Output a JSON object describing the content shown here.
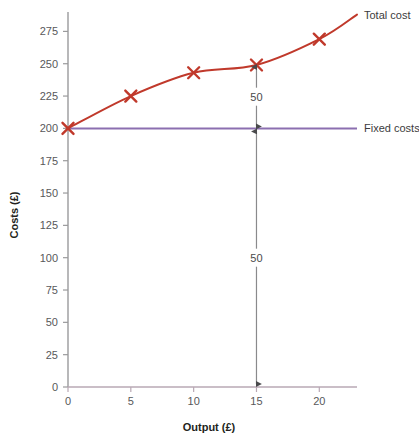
{
  "chart_data": {
    "type": "line",
    "title": "",
    "xlabel": "Output (£)",
    "ylabel": "Costs (£)",
    "xlim": [
      0,
      23
    ],
    "ylim": [
      0,
      290
    ],
    "grid": false,
    "legend_position": "right-of-plot-end-labels",
    "xticks": [
      "0",
      "5",
      "10",
      "15",
      "20"
    ],
    "xtick_values": [
      0,
      5,
      10,
      15,
      20
    ],
    "yticks": [
      "0",
      "25",
      "50",
      "75",
      "100",
      "125",
      "150",
      "175",
      "200",
      "225",
      "250",
      "275"
    ],
    "ytick_values": [
      0,
      25,
      50,
      75,
      100,
      125,
      150,
      175,
      200,
      225,
      250,
      275
    ],
    "series": [
      {
        "name": "Total cost",
        "color": "#c0392b",
        "marker": "x",
        "x": [
          0,
          5,
          10,
          15,
          20
        ],
        "values": [
          200,
          225,
          243,
          249,
          269
        ],
        "curve_end": {
          "x": 23,
          "y": 288
        }
      },
      {
        "name": "Fixed costs",
        "color": "#8b6fb0",
        "marker": "none",
        "x": [
          0,
          23
        ],
        "values": [
          200,
          200
        ]
      }
    ],
    "annotations": [
      {
        "label": "50",
        "at_x": 15,
        "from_y": 249,
        "to_y": 200,
        "meaning": "variable cost at output 15"
      },
      {
        "label": "50",
        "at_x": 15,
        "from_y": 200,
        "to_y": 0,
        "meaning": "fixed cost at output 15"
      }
    ]
  },
  "labels": {
    "total_cost": "Total cost",
    "fixed_costs": "Fixed costs",
    "x_axis_title": "Output (£)",
    "y_axis_title": "Costs (£)",
    "annotation_upper": "50",
    "annotation_lower": "50"
  },
  "colors": {
    "total_cost_line": "#c0392b",
    "fixed_costs_line": "#8b6fb0",
    "axis": "#9a9a9c",
    "annotation_arrow": "#6e6e70",
    "tick_text": "#58585a",
    "title_text": "#231f20",
    "background": "#ffffff"
  }
}
